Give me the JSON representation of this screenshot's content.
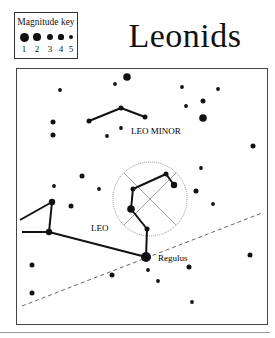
{
  "title": "Leonids",
  "magnitude_key": {
    "title": "Magnitude key",
    "entries": [
      {
        "label": "1",
        "r": 4.5
      },
      {
        "label": "2",
        "r": 3.8
      },
      {
        "label": "3",
        "r": 3.2
      },
      {
        "label": "4",
        "r": 2.6
      },
      {
        "label": "5",
        "r": 2.0
      }
    ]
  },
  "labels": {
    "leo_minor": "LEO MINOR",
    "leo": "LEO",
    "regulus": "Regulus"
  },
  "colors": {
    "ink": "#111111",
    "frame": "#444444",
    "dashed": "#666666"
  },
  "stars": [
    {
      "x": 127,
      "y": 77,
      "mag": 2
    },
    {
      "x": 115,
      "y": 84,
      "mag": 5
    },
    {
      "x": 60,
      "y": 90,
      "mag": 5
    },
    {
      "x": 182,
      "y": 87,
      "mag": 5
    },
    {
      "x": 218,
      "y": 89,
      "mag": 5
    },
    {
      "x": 203,
      "y": 101,
      "mag": 4
    },
    {
      "x": 186,
      "y": 106,
      "mag": 5
    },
    {
      "x": 203,
      "y": 118,
      "mag": 2
    },
    {
      "x": 89,
      "y": 121,
      "mag": 4
    },
    {
      "x": 121,
      "y": 108,
      "mag": 4
    },
    {
      "x": 145,
      "y": 117,
      "mag": 4
    },
    {
      "x": 121,
      "y": 128,
      "mag": 5
    },
    {
      "x": 53,
      "y": 122,
      "mag": 4
    },
    {
      "x": 53,
      "y": 135,
      "mag": 4
    },
    {
      "x": 107,
      "y": 136,
      "mag": 5
    },
    {
      "x": 253,
      "y": 146,
      "mag": 4
    },
    {
      "x": 201,
      "y": 168,
      "mag": 5
    },
    {
      "x": 196,
      "y": 191,
      "mag": 4
    },
    {
      "x": 82,
      "y": 176,
      "mag": 4
    },
    {
      "x": 54,
      "y": 186,
      "mag": 5
    },
    {
      "x": 99,
      "y": 189,
      "mag": 5
    },
    {
      "x": 52,
      "y": 202,
      "mag": 3
    },
    {
      "x": 71,
      "y": 206,
      "mag": 4
    },
    {
      "x": 49,
      "y": 232,
      "mag": 3
    },
    {
      "x": 166,
      "y": 174,
      "mag": 4
    },
    {
      "x": 174,
      "y": 185,
      "mag": 3
    },
    {
      "x": 133,
      "y": 189,
      "mag": 4
    },
    {
      "x": 131,
      "y": 209,
      "mag": 2
    },
    {
      "x": 147,
      "y": 229,
      "mag": 4
    },
    {
      "x": 146,
      "y": 257,
      "mag": 1
    },
    {
      "x": 32,
      "y": 265,
      "mag": 4
    },
    {
      "x": 32,
      "y": 293,
      "mag": 4
    },
    {
      "x": 112,
      "y": 275,
      "mag": 4
    },
    {
      "x": 148,
      "y": 270,
      "mag": 5
    },
    {
      "x": 158,
      "y": 281,
      "mag": 5
    },
    {
      "x": 189,
      "y": 267,
      "mag": 4
    },
    {
      "x": 192,
      "y": 302,
      "mag": 5
    },
    {
      "x": 250,
      "y": 255,
      "mag": 4
    },
    {
      "x": 213,
      "y": 204,
      "mag": 5
    }
  ],
  "lines": [
    [
      89,
      121,
      121,
      108
    ],
    [
      121,
      108,
      145,
      117
    ],
    [
      20,
      220,
      52,
      202
    ],
    [
      52,
      202,
      49,
      232
    ],
    [
      49,
      232,
      22,
      232
    ],
    [
      49,
      232,
      146,
      257
    ],
    [
      133,
      189,
      166,
      174
    ],
    [
      166,
      174,
      174,
      185
    ],
    [
      133,
      189,
      131,
      209
    ],
    [
      131,
      209,
      147,
      229
    ],
    [
      147,
      229,
      146,
      257
    ]
  ],
  "radiant_circle": {
    "cx": 150,
    "cy": 199,
    "r": 37
  },
  "ecliptic": [
    22,
    306,
    262,
    213
  ]
}
